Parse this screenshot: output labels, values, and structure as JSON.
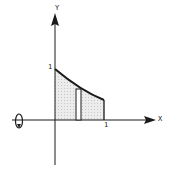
{
  "diagram": {
    "axes": {
      "x_label": "X",
      "y_label": "Y",
      "x_tick": "1",
      "y_tick": "1"
    },
    "curve": {
      "description": "decreasing curve from (0,1) to (1, ~0.4)",
      "x_range": [
        0,
        1
      ]
    },
    "region": {
      "shading": "stippled gray",
      "fill_color": "#e4e4e4"
    },
    "strip": {
      "description": "thin vertical rectangular strip under curve"
    },
    "rotation": {
      "axis": "x-axis",
      "icon": "rotation-arrow-icon"
    },
    "colors": {
      "line": "#1a1a1a",
      "fill": "#e4e4e4",
      "background": "#ffffff"
    }
  }
}
